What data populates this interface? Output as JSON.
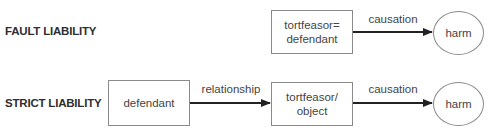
{
  "diagram": {
    "rows": [
      {
        "label": "FAULT LIABILITY",
        "nodes": [
          {
            "id": "tortfeasor_defendant",
            "shape": "rectangle",
            "line1": "tortfeasor=",
            "line2": "defendant"
          },
          {
            "id": "harm_1",
            "shape": "ellipse",
            "text": "harm"
          }
        ],
        "edges": [
          {
            "from": "tortfeasor_defendant",
            "to": "harm_1",
            "label": "causation"
          }
        ]
      },
      {
        "label": "STRICT LIABILITY",
        "nodes": [
          {
            "id": "defendant",
            "shape": "rectangle",
            "text": "defendant"
          },
          {
            "id": "tortfeasor_object",
            "shape": "rectangle",
            "line1": "tortfeasor/",
            "line2": "object"
          },
          {
            "id": "harm_2",
            "shape": "ellipse",
            "text": "harm"
          }
        ],
        "edges": [
          {
            "from": "defendant",
            "to": "tortfeasor_object",
            "label": "relationship"
          },
          {
            "from": "tortfeasor_object",
            "to": "harm_2",
            "label": "causation"
          }
        ]
      }
    ],
    "colors": {
      "stroke": "#8a8a8a",
      "arrow": "#222222",
      "text": "#444444"
    }
  }
}
